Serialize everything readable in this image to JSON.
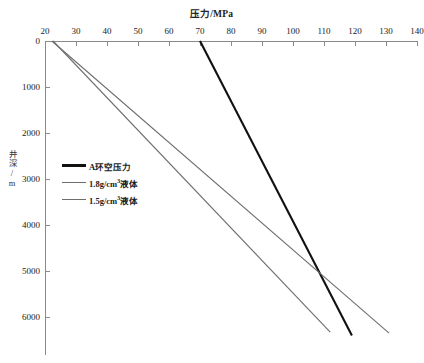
{
  "chart_data": {
    "type": "line",
    "title": "压力/MPa",
    "xlabel": "压力/MPa",
    "ylabel": "井深/m",
    "xlim": [
      20,
      140
    ],
    "ylim": [
      0,
      6500
    ],
    "y_inverted": true,
    "grid": false,
    "legend_position": "inside-left",
    "xticks": [
      20,
      30,
      40,
      50,
      60,
      70,
      80,
      90,
      100,
      110,
      120,
      130,
      140
    ],
    "yticks": [
      0,
      1000,
      2000,
      3000,
      4000,
      5000,
      6000
    ],
    "xtick_labels": [
      "20",
      "30",
      "40",
      "50",
      "60",
      "70",
      "80",
      "90",
      "100",
      "110",
      "120",
      "130",
      "140"
    ],
    "ytick_labels": [
      "0",
      "1000",
      "2000",
      "3000",
      "4000",
      "5000",
      "6000"
    ],
    "series": [
      {
        "name": "A环空压力",
        "label_html": "A环空压力",
        "color": "#111111",
        "width": 2.1,
        "points": [
          [
            70,
            0
          ],
          [
            119,
            6400
          ]
        ]
      },
      {
        "name": "1.8g/cm3液体",
        "label_html": "1.8g/cm<sup>3</sup>液体",
        "color": "#6e6e6e",
        "width": 1.1,
        "points": [
          [
            22.6,
            0
          ],
          [
            112,
            6330
          ]
        ]
      },
      {
        "name": "1.5g/cm3液体",
        "label_html": "1.5g/cm<sup>3</sup>液体",
        "color": "#6e6e6e",
        "width": 1.1,
        "points": [
          [
            22.2,
            0
          ],
          [
            131,
            6350
          ]
        ]
      }
    ]
  },
  "axes": {
    "x_title_text": "压力/MPa",
    "y_title_text": "井深/m"
  },
  "legend": {
    "items": [
      {
        "label": "A环空压力",
        "color": "#111111"
      },
      {
        "label": "1.8g/cm3液体",
        "color": "#6e6e6e"
      },
      {
        "label": "1.5g/cm3液体",
        "color": "#6e6e6e"
      }
    ]
  }
}
